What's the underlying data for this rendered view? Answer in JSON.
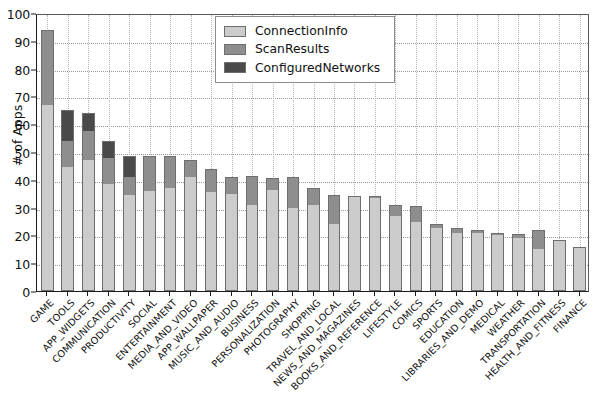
{
  "chart_data": {
    "type": "bar",
    "stacked": true,
    "title": "",
    "xlabel": "",
    "ylabel": "# of Apps",
    "ylim": [
      0,
      100
    ],
    "ytick_labels": [
      "0",
      "10",
      "20",
      "30",
      "40",
      "50",
      "60",
      "70",
      "80",
      "90",
      "100"
    ],
    "yticks": [
      0,
      10,
      20,
      30,
      40,
      50,
      60,
      70,
      80,
      90,
      100
    ],
    "grid": true,
    "legend_position": "upper center-right",
    "categories": [
      "GAME",
      "TOOLS",
      "APP_WIDGETS",
      "COMMUNICATION",
      "PRODUCTIVITY",
      "SOCIAL",
      "ENTERTAINMENT",
      "MEDIA_AND_VIDEO",
      "APP_WALLPAPER",
      "MUSIC_AND_AUDIO",
      "BUSINESS",
      "PERSONALIZATION",
      "PHOTOGRAPHY",
      "SHOPPING",
      "TRAVEL_AND_LOCAL",
      "NEWS_AND_MAGAZINES",
      "BOOKS_AND_REFERENCE",
      "LIFESTYLE",
      "COMICS",
      "SPORTS",
      "EDUCATION",
      "LIBRARIES_AND_DEMO",
      "MEDICAL",
      "WEATHER",
      "TRANSPORTATION",
      "HEALTH_AND_FITNESS",
      "FINANCE"
    ],
    "series": [
      {
        "name": "ConnectionInfo",
        "color": "#cccccc",
        "values": [
          67,
          44.5,
          47,
          38.5,
          34.5,
          36,
          37,
          41,
          35.5,
          35,
          31,
          36.5,
          30,
          31,
          24,
          34,
          33.5,
          27,
          25,
          22.5,
          21,
          21,
          20,
          19,
          15,
          18,
          16
        ]
      },
      {
        "name": "ScanResults",
        "color": "#8e8e8e",
        "values": [
          27,
          9.5,
          10.5,
          9.5,
          6.5,
          12.5,
          11.5,
          6,
          8.5,
          6,
          10.5,
          4,
          11,
          6,
          10.5,
          0,
          0.5,
          4,
          5.5,
          1.5,
          1.5,
          1,
          1,
          1.5,
          7,
          0.5,
          0
        ]
      },
      {
        "name": "ConfiguredNetworks",
        "color": "#4a4a4a",
        "values": [
          0,
          11,
          6.5,
          6,
          7.5,
          0,
          0,
          0,
          0,
          0,
          0,
          0,
          0,
          0,
          0,
          0,
          0,
          0,
          0,
          0,
          0,
          0,
          0,
          0,
          0,
          0,
          0
        ]
      }
    ],
    "legend": [
      {
        "label": "ConnectionInfo",
        "color": "#cccccc"
      },
      {
        "label": "ScanResults",
        "color": "#8e8e8e"
      },
      {
        "label": "ConfiguredNetworks",
        "color": "#4a4a4a"
      }
    ]
  }
}
